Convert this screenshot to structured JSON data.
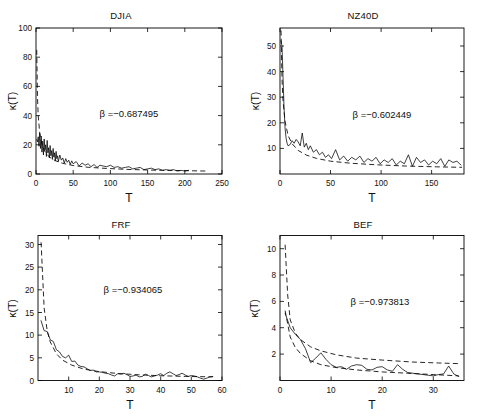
{
  "figure": {
    "layout": "2x2 grid of line plots",
    "background": "#ffffff",
    "line_color": "#000000"
  },
  "panels": [
    {
      "title": "DJIA",
      "xlabel": "T",
      "ylabel": "κ(T)",
      "beta_label": "β =−0.687495"
    },
    {
      "title": "NZ40D",
      "xlabel": "T",
      "ylabel": "κ(T)",
      "beta_label": "β =−0.602449"
    },
    {
      "title": "FRF",
      "xlabel": "T",
      "ylabel": "κ(T)",
      "beta_label": "β =−0.934065"
    },
    {
      "title": "BEF",
      "xlabel": "T",
      "ylabel": "κ(T)",
      "beta_label": "β =−0.973813"
    }
  ],
  "chart_data": [
    {
      "type": "line",
      "title": "DJIA",
      "xlabel": "T",
      "ylabel": "κ(T)",
      "xlim": [
        0,
        250
      ],
      "ylim": [
        0,
        100
      ],
      "xticks": [
        0,
        50,
        100,
        150,
        200,
        250
      ],
      "yticks": [
        0,
        20,
        40,
        60,
        80,
        100
      ],
      "grid": false,
      "legend": "none",
      "annotations": [
        {
          "text": "β =−0.687495",
          "x": 120,
          "y": 55
        }
      ],
      "series": [
        {
          "name": "empirical kurtosis",
          "style": "solid",
          "x": [
            1,
            2,
            3,
            4,
            5,
            6,
            7,
            8,
            9,
            10,
            11,
            12,
            13,
            14,
            15,
            16,
            17,
            18,
            19,
            20,
            21,
            22,
            23,
            24,
            25,
            26,
            27,
            28,
            29,
            30,
            32,
            34,
            36,
            38,
            40,
            42,
            44,
            46,
            48,
            50,
            54,
            58,
            62,
            66,
            70,
            74,
            78,
            82,
            86,
            90,
            95,
            100,
            105,
            110,
            115,
            120,
            125,
            130,
            135,
            140,
            145,
            150,
            155,
            160,
            165,
            170,
            175,
            180,
            185,
            190,
            195,
            200,
            205
          ],
          "values": [
            23.5,
            22.0,
            25.5,
            19.0,
            28.0,
            17.5,
            26.0,
            15.0,
            22.5,
            13.0,
            24.0,
            16.5,
            20.0,
            12.0,
            23.0,
            14.5,
            18.0,
            11.0,
            19.5,
            12.5,
            16.0,
            10.0,
            17.5,
            11.5,
            14.5,
            9.0,
            15.5,
            10.5,
            12.5,
            8.5,
            13.0,
            9.5,
            11.0,
            7.5,
            10.5,
            8.0,
            9.5,
            6.5,
            9.0,
            7.0,
            8.5,
            5.5,
            7.5,
            6.0,
            7.0,
            5.0,
            6.5,
            4.5,
            6.0,
            5.5,
            5.0,
            6.0,
            4.5,
            5.0,
            4.0,
            4.5,
            5.0,
            3.5,
            4.0,
            4.5,
            3.0,
            3.5,
            4.0,
            3.0,
            3.5,
            2.5,
            3.0,
            2.5,
            3.0,
            2.0,
            2.5,
            2.0,
            2.5
          ]
        },
        {
          "name": "power-law fit",
          "style": "dashed",
          "x": [
            1,
            2,
            3,
            5,
            8,
            12,
            18,
            26,
            36,
            50,
            70,
            95,
            125,
            160,
            200,
            230
          ],
          "values": [
            85.0,
            52.8,
            39.9,
            28.0,
            20.2,
            15.4,
            11.6,
            9.1,
            7.3,
            5.8,
            4.6,
            3.8,
            3.1,
            2.6,
            2.3,
            2.0
          ]
        }
      ]
    },
    {
      "type": "line",
      "title": "NZ40D",
      "xlabel": "T",
      "ylabel": "κ(T)",
      "xlim": [
        0,
        182
      ],
      "ylim": [
        0,
        57
      ],
      "xticks": [
        0,
        50,
        100,
        150
      ],
      "yticks": [
        10,
        20,
        30,
        40,
        50
      ],
      "grid": false,
      "legend": "none",
      "annotations": [
        {
          "text": "β =−0.602449",
          "x": 95,
          "y": 30
        }
      ],
      "series": [
        {
          "name": "empirical kurtosis",
          "style": "solid",
          "x": [
            1,
            2,
            3,
            4,
            5,
            6,
            7,
            8,
            10,
            12,
            14,
            16,
            18,
            20,
            22,
            24,
            26,
            28,
            30,
            33,
            36,
            39,
            42,
            45,
            48,
            51,
            55,
            59,
            63,
            67,
            71,
            75,
            79,
            83,
            87,
            91,
            95,
            99,
            103,
            107,
            111,
            115,
            119,
            123,
            127,
            131,
            135,
            139,
            143,
            147,
            151,
            155,
            159,
            163,
            167,
            171,
            175,
            179
          ],
          "values": [
            52.0,
            50.0,
            38.0,
            26.0,
            18.0,
            14.0,
            12.0,
            11.0,
            11.5,
            13.0,
            12.0,
            13.5,
            12.5,
            11.0,
            16.0,
            10.5,
            12.0,
            9.5,
            11.0,
            8.5,
            9.5,
            7.5,
            8.5,
            6.5,
            7.5,
            6.0,
            9.5,
            5.5,
            7.0,
            5.0,
            6.5,
            5.5,
            7.0,
            4.5,
            6.0,
            5.0,
            6.5,
            4.0,
            5.5,
            4.5,
            6.0,
            3.5,
            5.0,
            4.0,
            7.5,
            3.0,
            6.5,
            4.5,
            5.5,
            3.5,
            5.0,
            4.0,
            6.0,
            3.0,
            5.5,
            4.5,
            5.0,
            3.5
          ]
        },
        {
          "name": "power-law fit",
          "style": "dashed",
          "x": [
            1,
            2,
            3,
            5,
            8,
            12,
            18,
            26,
            36,
            50,
            70,
            95,
            125,
            155,
            180
          ],
          "values": [
            56.0,
            37.0,
            28.5,
            20.5,
            15.0,
            11.8,
            9.2,
            7.4,
            6.1,
            5.0,
            4.2,
            3.6,
            3.1,
            2.8,
            2.6
          ]
        }
      ]
    },
    {
      "type": "line",
      "title": "FRF",
      "xlabel": "T",
      "ylabel": "κ(T)",
      "xlim": [
        0,
        60
      ],
      "ylim": [
        0,
        32
      ],
      "xticks": [
        10,
        20,
        30,
        40,
        50,
        60
      ],
      "yticks": [
        0,
        5,
        10,
        15,
        20,
        25,
        30
      ],
      "grid": false,
      "legend": "none",
      "annotations": [
        {
          "text": "β =−0.934065",
          "x": 30,
          "y": 20
        }
      ],
      "series": [
        {
          "name": "empirical kurtosis",
          "style": "solid",
          "x": [
            1,
            2,
            3,
            4,
            5,
            6,
            7,
            8,
            9,
            10,
            11,
            12,
            13,
            14,
            15,
            16,
            17,
            18,
            19,
            20,
            21,
            22,
            23,
            24,
            25,
            26,
            27,
            28,
            29,
            30,
            31,
            32,
            33,
            34,
            35,
            36,
            37,
            38,
            39,
            40,
            41,
            42,
            43,
            44,
            45,
            46,
            47,
            48,
            49,
            50,
            51,
            52,
            53,
            54,
            55,
            56,
            57
          ],
          "values": [
            13.2,
            11.0,
            10.8,
            9.0,
            8.6,
            6.8,
            6.3,
            5.3,
            5.0,
            5.6,
            4.2,
            4.3,
            3.4,
            3.1,
            3.0,
            2.6,
            2.2,
            2.3,
            1.9,
            1.9,
            1.8,
            1.6,
            1.5,
            1.2,
            1.0,
            1.5,
            1.4,
            1.6,
            1.3,
            0.9,
            1.0,
            1.2,
            0.8,
            0.9,
            1.4,
            1.1,
            0.8,
            1.0,
            1.2,
            1.5,
            1.1,
            1.6,
            1.9,
            1.5,
            1.1,
            1.3,
            1.6,
            1.2,
            0.9,
            1.1,
            1.0,
            0.8,
            0.5,
            0.3,
            0.5,
            0.8,
            0.9
          ]
        },
        {
          "name": "power-law fit",
          "style": "dashed",
          "x": [
            1,
            2,
            3,
            4,
            6,
            8,
            11,
            15,
            20,
            26,
            33,
            40,
            48,
            57
          ],
          "values": [
            30.5,
            16.0,
            11.0,
            8.5,
            5.9,
            4.5,
            3.4,
            2.5,
            1.95,
            1.55,
            1.25,
            1.05,
            0.9,
            0.8
          ]
        }
      ]
    },
    {
      "type": "line",
      "title": "BEF",
      "xlabel": "T",
      "ylabel": "κ(T)",
      "xlim": [
        0,
        36
      ],
      "ylim": [
        0,
        11
      ],
      "xticks": [
        0,
        10,
        20,
        30
      ],
      "yticks": [
        2,
        4,
        6,
        8,
        10
      ],
      "grid": false,
      "legend": "none",
      "annotations": [
        {
          "text": "β =−0.973813",
          "x": 18,
          "y": 6
        }
      ],
      "series": [
        {
          "name": "empirical kurtosis",
          "style": "solid",
          "x": [
            1,
            2,
            3,
            4,
            5,
            6,
            7,
            8,
            9,
            10,
            11,
            12,
            13,
            14,
            15,
            16,
            17,
            18,
            19,
            20,
            21,
            22,
            23,
            24,
            25,
            26,
            27,
            28,
            29,
            30,
            31,
            32,
            33,
            34,
            35
          ],
          "values": [
            5.1,
            4.0,
            3.5,
            3.1,
            2.4,
            1.35,
            1.7,
            2.1,
            1.6,
            1.2,
            1.0,
            1.05,
            0.85,
            1.1,
            1.2,
            1.15,
            0.85,
            0.8,
            1.0,
            1.05,
            0.8,
            0.7,
            1.2,
            0.85,
            0.6,
            0.55,
            0.5,
            0.45,
            0.4,
            0.35,
            0.45,
            0.5,
            1.1,
            0.5,
            0.3
          ]
        },
        {
          "name": "power-law fit (upper)",
          "style": "dashed",
          "x": [
            1,
            1.5,
            2,
            3,
            4,
            6,
            8,
            11,
            15,
            20,
            26,
            31,
            35
          ],
          "values": [
            10.3,
            6.5,
            4.6,
            3.6,
            3.1,
            2.55,
            2.25,
            1.95,
            1.7,
            1.55,
            1.4,
            1.33,
            1.28
          ]
        },
        {
          "name": "power-law fit (lower)",
          "style": "dashed",
          "x": [
            1,
            2,
            3,
            4,
            6,
            8,
            11,
            15,
            20,
            25,
            30,
            35
          ],
          "values": [
            5.3,
            3.3,
            2.5,
            2.05,
            1.5,
            1.2,
            0.98,
            0.8,
            0.65,
            0.55,
            0.45,
            0.35
          ]
        }
      ]
    }
  ]
}
